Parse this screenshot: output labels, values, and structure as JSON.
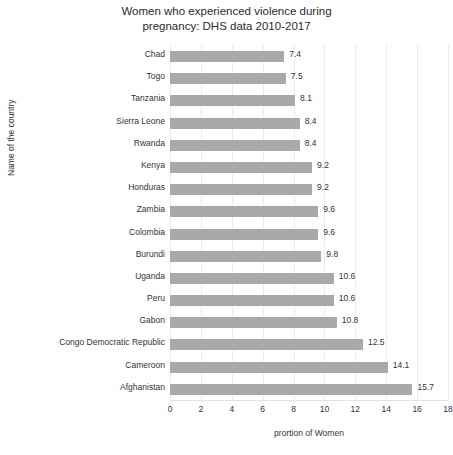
{
  "chart_data": {
    "type": "bar",
    "orientation": "horizontal",
    "title": "Women who experienced violence during\npregnancy: DHS data 2010-2017",
    "xlabel": "prortion of Women",
    "ylabel": "Name of the country",
    "xlim": [
      0,
      18
    ],
    "xticks": [
      0,
      2,
      4,
      6,
      8,
      10,
      12,
      14,
      16,
      18
    ],
    "grid": "vertical",
    "legend": null,
    "bar_color": "#a9a9a9",
    "grid_color": "#ececec",
    "categories": [
      "Chad",
      "Togo",
      "Tanzania",
      "Sierra Leone",
      "Rwanda",
      "Kenya",
      "Honduras",
      "Zambia",
      "Colombia",
      "Burundi",
      "Uganda",
      "Peru",
      "Gabon",
      "Congo Democratic Republic",
      "Cameroon",
      "Afghanistan"
    ],
    "values": [
      7.4,
      7.5,
      8.1,
      8.4,
      8.4,
      9.2,
      9.2,
      9.6,
      9.6,
      9.8,
      10.6,
      10.6,
      10.8,
      12.5,
      14.1,
      15.7
    ],
    "value_labels": [
      "7.4",
      "7.5",
      "8.1",
      "8.4",
      "8.4",
      "9.2",
      "9.2",
      "9.6",
      "9.6",
      "9.8",
      "10.6",
      "10.6",
      "10.8",
      "12.5",
      "14.1",
      "15.7"
    ]
  },
  "footer": {
    "clipped_text": ""
  }
}
